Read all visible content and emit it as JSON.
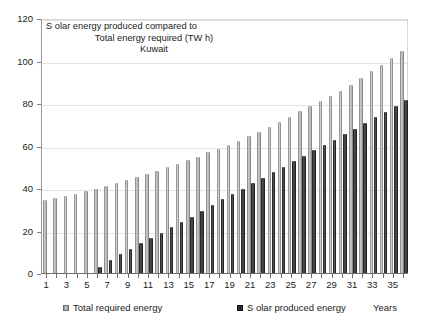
{
  "chart_data": {
    "type": "bar",
    "title_lines": [
      "S olar energy produced compared to",
      "Total energy required (TW h)",
      "Kuwait"
    ],
    "xlabel": "Years",
    "ylabel": "",
    "ylim": [
      0,
      120
    ],
    "yticks": [
      0,
      20,
      40,
      60,
      80,
      100,
      120
    ],
    "grid": true,
    "legend_position": "bottom",
    "categories": [
      1,
      2,
      3,
      4,
      5,
      6,
      7,
      8,
      9,
      10,
      11,
      12,
      13,
      14,
      15,
      16,
      17,
      18,
      19,
      20,
      21,
      22,
      23,
      24,
      25,
      26,
      27,
      28,
      29,
      30,
      31,
      32,
      33,
      34,
      35,
      36
    ],
    "series": [
      {
        "name": "Total required energy",
        "color": "#9c9c9c",
        "values": [
          34.5,
          35.3,
          36.2,
          37.2,
          38.5,
          39.6,
          40.8,
          42.3,
          43.8,
          45.2,
          46.6,
          48.2,
          49.9,
          51.5,
          53.2,
          54.8,
          56.8,
          58.5,
          60.4,
          62.1,
          64.3,
          66.4,
          68.6,
          71.3,
          73.6,
          76.1,
          78.5,
          80.8,
          83.4,
          85.8,
          88.7,
          92.0,
          94.9,
          98.0,
          101.0,
          104.5
        ]
      },
      {
        "name": "S olar produced energy",
        "color": "#2a2a2a",
        "values": [
          0,
          0,
          0,
          0,
          0,
          3.0,
          6.0,
          8.8,
          11.4,
          14.2,
          16.5,
          19.0,
          21.6,
          24.0,
          26.5,
          29.4,
          32.0,
          34.6,
          37.0,
          39.5,
          42.2,
          44.8,
          47.4,
          50.1,
          52.7,
          55.1,
          58.0,
          60.4,
          62.7,
          65.5,
          68.0,
          70.7,
          73.6,
          76.0,
          78.5,
          81.2
        ]
      }
    ],
    "xtick_labels": [
      1,
      3,
      5,
      7,
      9,
      11,
      13,
      15,
      17,
      19,
      21,
      23,
      25,
      27,
      29,
      31,
      33,
      35
    ]
  },
  "legend": {
    "total_label": "Total required energy",
    "solar_label": "S olar produced energy",
    "axis_label": "Years"
  }
}
